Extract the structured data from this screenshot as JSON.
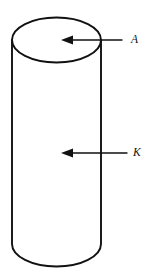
{
  "figure": {
    "type": "technical-line-diagram",
    "background_color": "#ffffff",
    "stroke_color": "#111111",
    "width": 159,
    "height": 271
  },
  "shape": {
    "name": "cylinder",
    "top_ellipse": {
      "cx": 56.5,
      "cy": 40,
      "rx": 44.5,
      "ry": 22.5
    },
    "left_wall_x": 12,
    "right_wall_x": 101,
    "body_top_y": 40,
    "body_bottom_y": 244,
    "bottom_arc_depth_y": 253
  },
  "annotations": [
    {
      "id": "label-a",
      "label": "A",
      "label_x": 131,
      "label_y": 40,
      "points_to": "top-face",
      "arrow": {
        "tail_x": 122,
        "tip_x": 62,
        "y": 40,
        "direction": "left"
      }
    },
    {
      "id": "label-k",
      "label": "K",
      "label_x": 133,
      "label_y": 153,
      "points_to": "lateral-surface",
      "arrow": {
        "tail_x": 127,
        "tip_x": 62,
        "y": 153,
        "direction": "left"
      }
    }
  ]
}
